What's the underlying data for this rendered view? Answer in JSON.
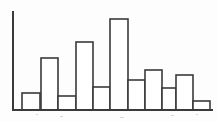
{
  "figure": {
    "name": "histogram",
    "background_color": "#fdfdfd",
    "stroke_color": "#3a3a3a",
    "fill_color": "#ffffff"
  },
  "chart_data": {
    "type": "bar",
    "title": "",
    "subtitle": "",
    "xlabel": "",
    "ylabel": "",
    "grid": false,
    "legend": "none",
    "categories": [
      "1",
      "2",
      "3",
      "4",
      "5",
      "6",
      "7",
      "8",
      "9",
      "10",
      "11"
    ],
    "values": [
      17,
      52,
      14,
      68,
      23,
      91,
      30,
      40,
      22,
      35,
      9
    ],
    "xlim": [
      0,
      11
    ],
    "ylim": [
      0,
      98
    ],
    "bar_edges_px": [
      {
        "x0": 22,
        "x1": 40,
        "top": 93,
        "height": 17
      },
      {
        "x0": 41,
        "x1": 58,
        "top": 58,
        "height": 52
      },
      {
        "x0": 58,
        "x1": 76,
        "top": 96,
        "height": 14
      },
      {
        "x0": 76,
        "x1": 93,
        "top": 42,
        "height": 68
      },
      {
        "x0": 93,
        "x1": 110,
        "top": 87,
        "height": 23
      },
      {
        "x0": 110,
        "x1": 128,
        "top": 19,
        "height": 91
      },
      {
        "x0": 128,
        "x1": 145,
        "top": 80,
        "height": 30
      },
      {
        "x0": 145,
        "x1": 162,
        "top": 70,
        "height": 40
      },
      {
        "x0": 162,
        "x1": 176,
        "top": 88,
        "height": 22
      },
      {
        "x0": 176,
        "x1": 193,
        "top": 75,
        "height": 35
      },
      {
        "x0": 193,
        "x1": 210,
        "top": 101,
        "height": 9
      }
    ],
    "axes": {
      "baseline_y": 110,
      "y_axis_x": 13,
      "y_axis_top": 12,
      "x_axis_x0": 13,
      "x_axis_x1": 212
    },
    "tick_labels_x": [],
    "tick_labels_y": [],
    "annotations": []
  }
}
